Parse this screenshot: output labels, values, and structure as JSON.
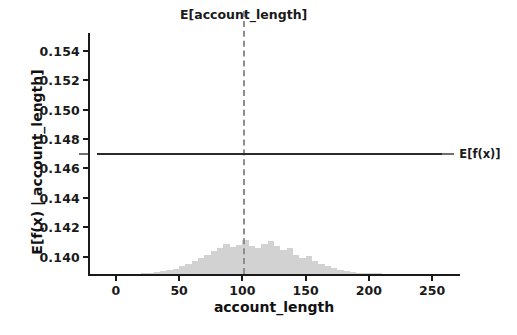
{
  "chart_data": {
    "type": "line",
    "title": "",
    "xlabel": "account_length",
    "ylabel": "E[f(x) | account_length]",
    "xlim": [
      -22,
      272
    ],
    "ylim": [
      0.1387,
      0.1552
    ],
    "grid": false,
    "legend_position": "right-inline",
    "xticks": [
      0,
      50,
      100,
      150,
      200,
      250
    ],
    "xtick_labels": [
      "0",
      "50",
      "100",
      "150",
      "200",
      "250"
    ],
    "yticks": [
      0.14,
      0.142,
      0.144,
      0.146,
      0.148,
      0.15,
      0.152,
      0.154
    ],
    "ytick_labels": [
      "0.140",
      "0.142",
      "0.144",
      "0.146",
      "0.148",
      "0.150",
      "0.152",
      "0.154"
    ],
    "series": [
      {
        "name": "E[f(x)]",
        "label": "E[f(x)]",
        "color": "#2b2b2b",
        "style": "solid",
        "constant_value": 0.147,
        "x": [
          -15,
          0,
          25,
          50,
          75,
          100,
          125,
          150,
          175,
          200,
          225,
          250,
          258
        ],
        "values": [
          0.147,
          0.147,
          0.147,
          0.147,
          0.147,
          0.147,
          0.147,
          0.147,
          0.147,
          0.147,
          0.147,
          0.147,
          0.147
        ]
      }
    ],
    "annotations": [
      {
        "name": "expected-feature-value",
        "label": "E[account_length]",
        "type": "vline",
        "x": 101,
        "style": "dashed",
        "color": "#8d8d8d"
      },
      {
        "name": "expected-model-output",
        "label": "E[f(x)]",
        "type": "hline-label",
        "y": 0.147,
        "style": "solid",
        "color": "#2b2b2b"
      }
    ],
    "histogram": {
      "name": "account_length-distribution",
      "color": "#d2d2d2",
      "bin_edges": [
        20,
        25,
        30,
        35,
        40,
        45,
        50,
        55,
        60,
        65,
        70,
        75,
        80,
        85,
        90,
        95,
        100,
        105,
        110,
        115,
        120,
        125,
        130,
        135,
        140,
        145,
        150,
        155,
        160,
        165,
        170,
        175,
        180,
        185,
        190,
        200,
        210
      ],
      "counts": [
        1,
        2,
        3,
        5,
        7,
        9,
        13,
        17,
        22,
        28,
        33,
        40,
        44,
        52,
        46,
        50,
        58,
        48,
        45,
        52,
        56,
        47,
        41,
        44,
        33,
        27,
        30,
        22,
        17,
        13,
        10,
        7,
        5,
        3,
        2,
        1
      ],
      "max_count": 58
    }
  }
}
